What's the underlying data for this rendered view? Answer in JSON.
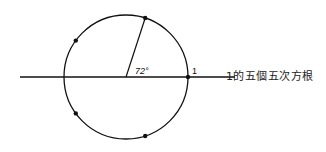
{
  "diagram": {
    "title": "1的五個五次方根",
    "angle_label": "72°",
    "unit_label": "1",
    "circle": {
      "cx": 126,
      "cy": 77,
      "r": 62
    },
    "axis": {
      "x1": 20,
      "x2": 235,
      "y": 77
    },
    "roots_angles_deg": [
      0,
      72,
      144,
      216,
      288
    ],
    "colors": {
      "stroke": "#111111",
      "background": "#ffffff"
    }
  }
}
